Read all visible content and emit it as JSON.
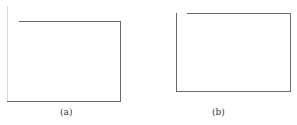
{
  "figures": [
    {
      "id": "a",
      "caption": "(a)"
    },
    {
      "id": "b",
      "caption": "(b)"
    }
  ],
  "colors": {
    "line": "#6a6a6a",
    "faint_line": "#d8d8d8",
    "background": "#ffffff"
  }
}
